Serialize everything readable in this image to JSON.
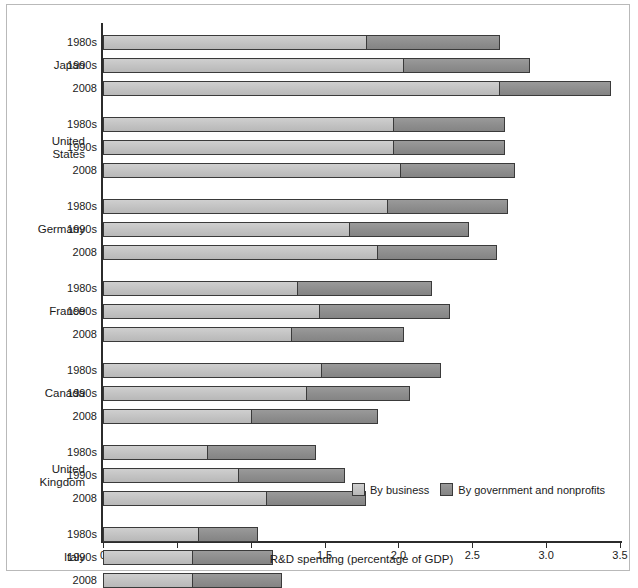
{
  "chart_data": {
    "type": "bar",
    "orientation": "horizontal",
    "stacked": true,
    "title": "",
    "xlabel": "R&D spending (percentage of GDP)",
    "ylabel": "",
    "xlim": [
      0,
      3.5
    ],
    "xticks": [
      "0",
      "0.5",
      "1.0",
      "1.5",
      "2.0",
      "2.5",
      "3.0",
      "3.5"
    ],
    "xtick_values": [
      0,
      0.5,
      1.0,
      1.5,
      2.0,
      2.5,
      3.0,
      3.5
    ],
    "grid": false,
    "legend_position": "bottom-right",
    "series": [
      {
        "name": "By business",
        "color": "#c3c3c3"
      },
      {
        "name": "By government and nonprofits",
        "color": "#8d8d8d"
      }
    ],
    "groups": [
      {
        "country": "Japan",
        "rows": [
          {
            "period": "1980s",
            "business": 1.79,
            "government": 0.9,
            "total": 2.69
          },
          {
            "period": "1990s",
            "business": 2.04,
            "government": 0.85,
            "total": 2.89
          },
          {
            "period": "2008",
            "business": 2.69,
            "government": 0.75,
            "total": 3.44
          }
        ]
      },
      {
        "country": "United States",
        "country_lines": [
          "United",
          "States"
        ],
        "rows": [
          {
            "period": "1980s",
            "business": 1.97,
            "government": 0.75,
            "total": 2.72
          },
          {
            "period": "1990s",
            "business": 1.97,
            "government": 0.75,
            "total": 2.72
          },
          {
            "period": "2008",
            "business": 2.02,
            "government": 0.77,
            "total": 2.79
          }
        ]
      },
      {
        "country": "Germany",
        "rows": [
          {
            "period": "1980s",
            "business": 1.93,
            "government": 0.81,
            "total": 2.74
          },
          {
            "period": "1990s",
            "business": 1.67,
            "government": 0.81,
            "total": 2.48
          },
          {
            "period": "2008",
            "business": 1.86,
            "government": 0.81,
            "total": 2.67
          }
        ]
      },
      {
        "country": "France",
        "rows": [
          {
            "period": "1980s",
            "business": 1.32,
            "government": 0.91,
            "total": 2.23
          },
          {
            "period": "1990s",
            "business": 1.47,
            "government": 0.88,
            "total": 2.35
          },
          {
            "period": "2008",
            "business": 1.28,
            "government": 0.76,
            "total": 2.04
          }
        ]
      },
      {
        "country": "Canada",
        "rows": [
          {
            "period": "1980s",
            "business": 1.48,
            "government": 0.81,
            "total": 2.29
          },
          {
            "period": "1990s",
            "business": 1.38,
            "government": 0.7,
            "total": 2.08
          },
          {
            "period": "2008",
            "business": 1.01,
            "government": 0.85,
            "total": 1.86
          }
        ]
      },
      {
        "country": "United Kingdom",
        "country_lines": [
          "United",
          "Kingdom"
        ],
        "rows": [
          {
            "period": "1980s",
            "business": 0.71,
            "government": 0.73,
            "total": 1.44
          },
          {
            "period": "1990s",
            "business": 0.92,
            "government": 0.72,
            "total": 1.64
          },
          {
            "period": "2008",
            "business": 1.11,
            "government": 0.67,
            "total": 1.78
          }
        ]
      },
      {
        "country": "Italy",
        "rows": [
          {
            "period": "1980s",
            "business": 0.65,
            "government": 0.4,
            "total": 1.05
          },
          {
            "period": "1990s",
            "business": 0.61,
            "government": 0.54,
            "total": 1.15
          },
          {
            "period": "2008",
            "business": 0.61,
            "government": 0.6,
            "total": 1.21
          }
        ]
      }
    ]
  }
}
